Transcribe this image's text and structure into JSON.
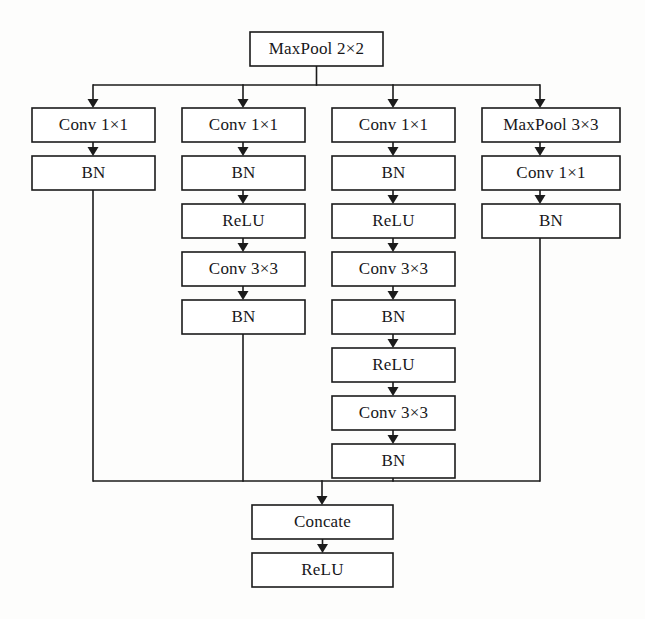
{
  "diagram": {
    "type": "flowchart",
    "background_color": "#fdfdfc",
    "line_color": "#1b1b1b",
    "box_fill_color": "#ffffff",
    "text_color": "#17171a",
    "input_node": {
      "id": "input",
      "label": "MaxPool 2×2",
      "x": 250,
      "y": 32,
      "w": 133,
      "h": 34
    },
    "branches": [
      {
        "name": "branch-1",
        "center_x": 93,
        "box_left": 32,
        "box_width": 123,
        "nodes": [
          {
            "id": "b1-n1",
            "label": "Conv 1×1",
            "y": 108
          },
          {
            "id": "b1-n2",
            "label": "BN",
            "y": 156
          }
        ]
      },
      {
        "name": "branch-2",
        "center_x": 243,
        "box_left": 182,
        "box_width": 123,
        "nodes": [
          {
            "id": "b2-n1",
            "label": "Conv 1×1",
            "y": 108
          },
          {
            "id": "b2-n2",
            "label": "BN",
            "y": 156
          },
          {
            "id": "b2-n3",
            "label": "ReLU",
            "y": 204
          },
          {
            "id": "b2-n4",
            "label": "Conv 3×3",
            "y": 252
          },
          {
            "id": "b2-n5",
            "label": "BN",
            "y": 300
          }
        ]
      },
      {
        "name": "branch-3",
        "center_x": 393,
        "box_left": 332,
        "box_width": 123,
        "nodes": [
          {
            "id": "b3-n1",
            "label": "Conv 1×1",
            "y": 108
          },
          {
            "id": "b3-n2",
            "label": "BN",
            "y": 156
          },
          {
            "id": "b3-n3",
            "label": "ReLU",
            "y": 204
          },
          {
            "id": "b3-n4",
            "label": "Conv 3×3",
            "y": 252
          },
          {
            "id": "b3-n5",
            "label": "BN",
            "y": 300
          },
          {
            "id": "b3-n6",
            "label": "ReLU",
            "y": 348
          },
          {
            "id": "b3-n7",
            "label": "Conv 3×3",
            "y": 396
          },
          {
            "id": "b3-n8",
            "label": "BN",
            "y": 444
          }
        ]
      },
      {
        "name": "branch-4",
        "center_x": 540,
        "box_left": 482,
        "box_width": 138,
        "nodes": [
          {
            "id": "b4-n1",
            "label": "MaxPool 3×3",
            "y": 108
          },
          {
            "id": "b4-n2",
            "label": "Conv 1×1",
            "y": 156
          },
          {
            "id": "b4-n3",
            "label": "BN",
            "y": 204
          }
        ]
      }
    ],
    "output_nodes": [
      {
        "id": "concate",
        "label": "Concate",
        "x": 252,
        "y": 505,
        "w": 141,
        "h": 34
      },
      {
        "id": "relu-out",
        "label": "ReLU",
        "x": 252,
        "y": 553,
        "w": 141,
        "h": 34
      }
    ],
    "buses": {
      "split_bus_y": 85,
      "split_trunk_x": 316,
      "merge_bus_y": 481,
      "merge_trunk_x": 322
    },
    "node_height": 34
  }
}
